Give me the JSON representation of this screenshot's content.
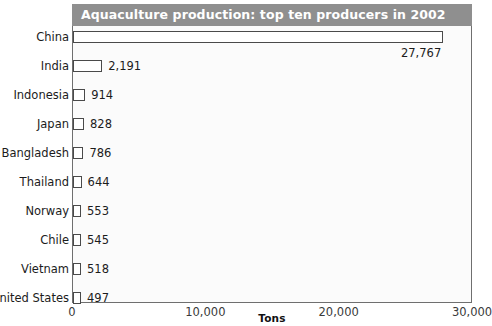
{
  "chart_data": {
    "type": "bar",
    "orientation": "horizontal",
    "title": "Aquaculture production: top ten producers in 2002",
    "xlabel": "Tons",
    "ylabel": "",
    "xlim": [
      0,
      30000
    ],
    "xticks": [
      0,
      10000,
      20000,
      30000
    ],
    "xticklabels": [
      "0",
      "10,000",
      "20,000",
      "30,000"
    ],
    "grid": false,
    "legend": null,
    "categories": [
      "China",
      "India",
      "Indonesia",
      "Japan",
      "Bangladesh",
      "Thailand",
      "Norway",
      "Chile",
      "Vietnam",
      "United States"
    ],
    "values": [
      27767,
      2191,
      914,
      828,
      786,
      644,
      553,
      545,
      518,
      497
    ],
    "value_labels": [
      "27,767",
      "2,191",
      "914",
      "828",
      "786",
      "644",
      "553",
      "545",
      "518",
      "497"
    ],
    "label_placement": [
      "below",
      "outside",
      "outside",
      "outside",
      "outside",
      "outside",
      "outside",
      "outside",
      "outside",
      "outside"
    ]
  },
  "style": {
    "title_bar_bg": "#8f8f8f",
    "title_text_color": "#ffffff",
    "plot_bg": "#fbfbfb",
    "plot_border": "#6f6f6f",
    "bar_fill": "#ffffff",
    "bar_stroke": "#4a4a4a",
    "text_color": "#1c1c1c",
    "tick_color": "#3a3a3a"
  }
}
